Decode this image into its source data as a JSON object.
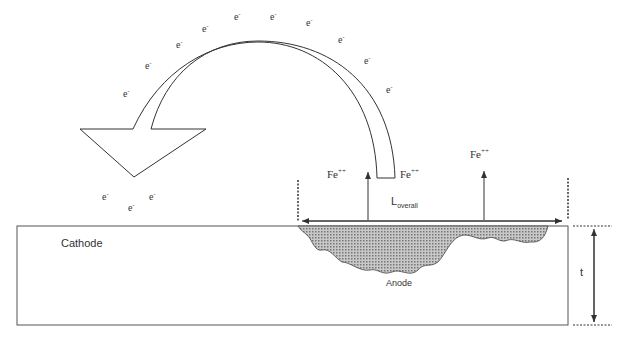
{
  "diagram": {
    "labels": {
      "cathode": "Cathode",
      "anode": "Anode",
      "length_main": "L",
      "length_sub": "overall",
      "thickness": "t",
      "ion_main": "Fe",
      "ion_charge": "++",
      "electron_main": "e",
      "electron_charge": "-"
    },
    "electrons_on_arc": 11,
    "electrons_near_arrowhead": 3,
    "ion_labels": 2,
    "colors": {
      "line": "#333333",
      "anode_fill": "#9a9a9a",
      "background": "#ffffff"
    }
  }
}
